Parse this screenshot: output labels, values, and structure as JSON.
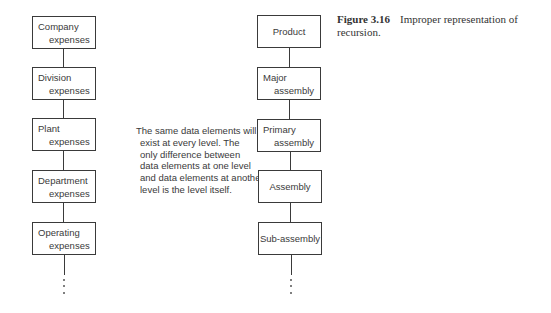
{
  "figure": {
    "number": "Figure 3.16",
    "caption_line1": "Improper representation of",
    "caption_line2": "recursion."
  },
  "left_hierarchy": {
    "nodes": [
      {
        "line1": "Company",
        "line2": "expenses"
      },
      {
        "line1": "Division",
        "line2": "expenses"
      },
      {
        "line1": "Plant",
        "line2": "expenses"
      },
      {
        "line1": "Department",
        "line2": "expenses"
      },
      {
        "line1": "Operating",
        "line2": "expenses"
      }
    ],
    "continuation": "⋮"
  },
  "note": {
    "lines": [
      "The same data elements will",
      "exist at every level. The",
      "only difference between",
      "data elements at one level",
      "and data elements at another",
      "level is the level itself."
    ]
  },
  "right_hierarchy": {
    "nodes": [
      {
        "line1": "Product",
        "line2": ""
      },
      {
        "line1": "Major",
        "line2": "assembly"
      },
      {
        "line1": "Primary",
        "line2": "assembly"
      },
      {
        "line1": "Assembly",
        "line2": ""
      },
      {
        "line1": "Sub-assembly",
        "line2": ""
      }
    ],
    "continuation": "⋮"
  }
}
